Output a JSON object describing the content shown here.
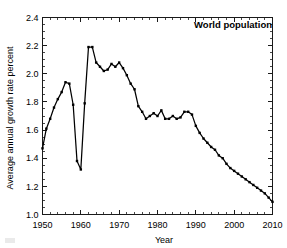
{
  "chart_data": {
    "type": "line",
    "title": "",
    "plot_label": "World population",
    "xlabel": "Year",
    "ylabel": "Average annual growth rate percent",
    "xlim": [
      1950,
      2010
    ],
    "ylim": [
      1.0,
      2.4
    ],
    "xticks": [
      1950,
      1960,
      1970,
      1980,
      1990,
      2000,
      2010
    ],
    "xtick_labels": [
      "1950",
      "1960",
      "1970",
      "1980",
      "1990",
      "2000",
      "2010"
    ],
    "yticks": [
      1.0,
      1.2,
      1.4,
      1.6,
      1.8,
      2.0,
      2.2,
      2.4
    ],
    "ytick_labels": [
      "1.0",
      "1.2",
      "1.4",
      "1.6",
      "1.8",
      "2.0",
      "2.2",
      "2.4"
    ],
    "x_minor_step": 2,
    "y_minor_step": 0.05,
    "grid": false,
    "legend": false,
    "markers": "square",
    "line_color": "#000000",
    "series": [
      {
        "name": "World population average annual growth rate percent",
        "x": [
          1950,
          1951,
          1952,
          1953,
          1954,
          1955,
          1956,
          1957,
          1958,
          1959,
          1960,
          1961,
          1962,
          1963,
          1964,
          1965,
          1966,
          1967,
          1968,
          1969,
          1970,
          1971,
          1972,
          1973,
          1974,
          1975,
          1976,
          1977,
          1978,
          1979,
          1980,
          1981,
          1982,
          1983,
          1984,
          1985,
          1986,
          1987,
          1988,
          1989,
          1990,
          1991,
          1992,
          1993,
          1994,
          1995,
          1996,
          1997,
          1998,
          1999,
          2000,
          2001,
          2002,
          2003,
          2004,
          2005,
          2006,
          2007,
          2008,
          2009,
          2010
        ],
        "values": [
          1.47,
          1.61,
          1.68,
          1.76,
          1.82,
          1.87,
          1.94,
          1.93,
          1.78,
          1.38,
          1.32,
          1.79,
          2.19,
          2.19,
          2.08,
          2.05,
          2.02,
          2.03,
          2.07,
          2.05,
          2.08,
          2.04,
          1.99,
          1.93,
          1.89,
          1.77,
          1.73,
          1.68,
          1.7,
          1.72,
          1.7,
          1.74,
          1.68,
          1.68,
          1.7,
          1.68,
          1.69,
          1.73,
          1.73,
          1.71,
          1.63,
          1.58,
          1.54,
          1.51,
          1.48,
          1.46,
          1.42,
          1.4,
          1.36,
          1.33,
          1.31,
          1.29,
          1.27,
          1.25,
          1.23,
          1.21,
          1.19,
          1.17,
          1.15,
          1.12,
          1.09
        ]
      }
    ]
  },
  "axes": {
    "x_title": "Year",
    "y_title": "Average annual growth rate percent"
  },
  "annotations": {
    "plot_label": "World population"
  }
}
